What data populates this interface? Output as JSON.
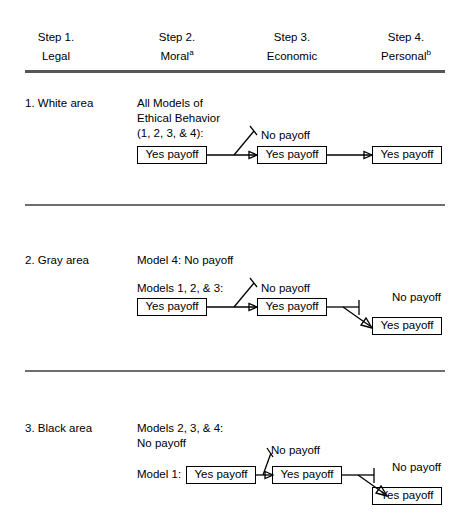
{
  "figure": {
    "type": "decision-flow-table",
    "title": "",
    "columns": [
      {
        "step": "Step 1.",
        "name": "Legal",
        "superscript": ""
      },
      {
        "step": "Step 2.",
        "name": "Moral",
        "superscript": "a"
      },
      {
        "step": "Step 3.",
        "name": "Economic",
        "superscript": ""
      },
      {
        "step": "Step 4.",
        "name": "Personal",
        "superscript": "b"
      }
    ],
    "sections": [
      {
        "id": "white-area",
        "label": "1. White area",
        "intro_lines": [
          "All Models of",
          "Ethical Behavior",
          "(1, 2, 3, & 4):"
        ],
        "prefix": "",
        "nodes": [
          {
            "id": "s1-n1",
            "text": "Yes payoff",
            "boxed": true
          },
          {
            "id": "s1-n2",
            "text": "Yes payoff",
            "boxed": true
          },
          {
            "id": "s1-n3",
            "text": "Yes payoff",
            "boxed": true
          }
        ],
        "branch_labels": [
          {
            "id": "s1-b1",
            "text": "No payoff"
          }
        ]
      },
      {
        "id": "gray-area",
        "label": "2. Gray area",
        "intro_lines": [
          "Model 4: No payoff"
        ],
        "sub_intro": "Models 1, 2, & 3:",
        "prefix": "",
        "nodes": [
          {
            "id": "s2-n1",
            "text": "Yes payoff",
            "boxed": true
          },
          {
            "id": "s2-n2",
            "text": "Yes payoff",
            "boxed": true
          },
          {
            "id": "s2-n3",
            "text": "Yes payoff",
            "boxed": true
          }
        ],
        "branch_labels": [
          {
            "id": "s2-b1",
            "text": "No payoff"
          },
          {
            "id": "s2-b2",
            "text": "No payoff"
          }
        ]
      },
      {
        "id": "black-area",
        "label": "3. Black area",
        "intro_lines": [
          "Models 2, 3, & 4:",
          "No payoff"
        ],
        "prefix": "Model 1:",
        "nodes": [
          {
            "id": "s3-n1",
            "text": "Yes payoff",
            "boxed": true
          },
          {
            "id": "s3-n2",
            "text": "Yes payoff",
            "boxed": true
          },
          {
            "id": "s3-n3",
            "text": "Yes payoff",
            "boxed": true
          }
        ],
        "branch_labels": [
          {
            "id": "s3-b1",
            "text": "No payoff"
          },
          {
            "id": "s3-b2",
            "text": "No payoff"
          }
        ]
      }
    ],
    "colors": {
      "ink": "#000000",
      "rule": "#6e6e6e",
      "background": "#ffffff"
    }
  }
}
